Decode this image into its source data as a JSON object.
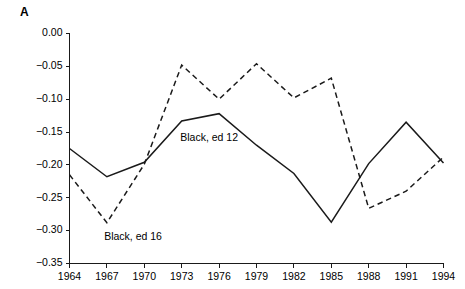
{
  "figure": {
    "panel_label": "A"
  },
  "chart_data": {
    "type": "line",
    "title": "",
    "subtitle": "",
    "xlabel": "",
    "ylabel": "",
    "x": [
      1964,
      1967,
      1970,
      1973,
      1976,
      1979,
      1982,
      1985,
      1988,
      1991,
      1994
    ],
    "xtick_labels": [
      "1964",
      "1967",
      "1970",
      "1973",
      "1976",
      "1979",
      "1982",
      "1985",
      "1988",
      "1991",
      "1994"
    ],
    "xlim": [
      1964,
      1994
    ],
    "ylim": [
      -0.35,
      0.0
    ],
    "ytick_values": [
      0.0,
      -0.05,
      -0.1,
      -0.15,
      -0.2,
      -0.25,
      -0.3,
      -0.35
    ],
    "ytick_labels": [
      "0.00",
      "−0.05",
      "−0.10",
      "−0.15",
      "−0.20",
      "−0.25",
      "−0.30",
      "−0.35"
    ],
    "grid": false,
    "legend_position": "inline-annotations",
    "series": [
      {
        "name": "Black, ed 12",
        "style": "solid",
        "color": "#1a1a1a",
        "values": [
          -0.175,
          -0.218,
          -0.196,
          -0.133,
          -0.122,
          -0.17,
          -0.213,
          -0.287,
          -0.198,
          -0.135,
          -0.197
        ]
      },
      {
        "name": "Black, ed 16",
        "style": "dashed",
        "color": "#1a1a1a",
        "values": [
          -0.215,
          -0.288,
          -0.199,
          -0.048,
          -0.1,
          -0.046,
          -0.098,
          -0.068,
          -0.266,
          -0.24,
          -0.188
        ]
      }
    ],
    "annotations": [
      {
        "text": "Black, ed 12",
        "x": 1975.2,
        "y": -0.159,
        "anchor": "middle"
      },
      {
        "text": "Black, ed 16",
        "x": 1969.1,
        "y": -0.31,
        "anchor": "middle"
      }
    ]
  }
}
